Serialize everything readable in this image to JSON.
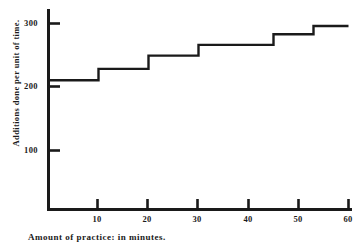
{
  "chart_data": {
    "type": "line",
    "subtype": "step",
    "title": "",
    "xlabel": "Amount of practice: in minutes.",
    "ylabel": "Additions done per unit of time.",
    "xlim": [
      0,
      60
    ],
    "ylim": [
      0,
      330
    ],
    "grid": false,
    "legend": null,
    "xticks": [
      10,
      20,
      30,
      40,
      50,
      60
    ],
    "xtick_labels": [
      "10",
      "20",
      "30",
      "40",
      "50",
      "60"
    ],
    "yticks": [
      100,
      200,
      300
    ],
    "ytick_labels": [
      "100",
      "200",
      "300"
    ],
    "x": [
      0,
      10,
      20,
      30,
      40,
      50,
      60
    ],
    "step_values": [
      210,
      228,
      249,
      266,
      283,
      296
    ],
    "series": [
      {
        "name": "Additions done per unit of time",
        "steps": [
          {
            "x_start": 0,
            "x_end": 10,
            "value": 210
          },
          {
            "x_start": 10,
            "x_end": 20,
            "value": 228
          },
          {
            "x_start": 20,
            "x_end": 30,
            "value": 249
          },
          {
            "x_start": 30,
            "x_end": 45,
            "value": 266
          },
          {
            "x_start": 45,
            "x_end": 53,
            "value": 283
          },
          {
            "x_start": 53,
            "x_end": 60,
            "value": 296
          }
        ]
      }
    ],
    "line_color": "#1a1a1a",
    "axis_color": "#1a1a1a",
    "background_color": "#ffffff"
  },
  "axes": {
    "y_axis_name": "y-axis",
    "x_axis_name": "x-axis"
  }
}
